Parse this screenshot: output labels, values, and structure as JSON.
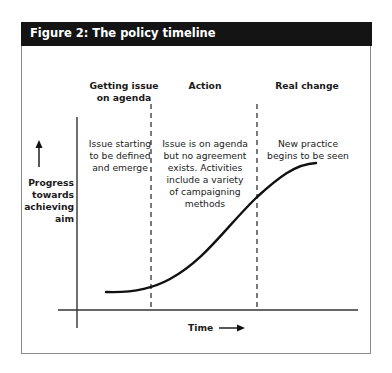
{
  "figure": {
    "title": "Figure 2: The policy timeline"
  },
  "phases": [
    {
      "heading": "Getting issue\non agenda",
      "description": "Issue starting\nto be defined\nand emerge"
    },
    {
      "heading": "Action",
      "description": "Issue is on agenda\nbut no agreement\nexists. Activities\ninclude a variety\nof campaigning\nmethods"
    },
    {
      "heading": "Real change",
      "description": "New practice\nbegins to be seen"
    }
  ],
  "axes": {
    "y_label": "Progress\ntowards\nachieving\naim",
    "x_label": "Time",
    "y_arrow_icon": "arrow-up-icon",
    "x_arrow_icon": "arrow-right-icon"
  },
  "colors": {
    "header_bg": "#141414",
    "header_text": "#ffffff",
    "line": "#111111",
    "frame": "#8a8a8a"
  }
}
